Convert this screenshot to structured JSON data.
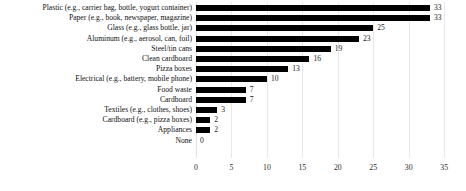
{
  "chart_data": {
    "type": "bar",
    "orientation": "horizontal",
    "title": "",
    "subtitle": "",
    "xlabel": "",
    "ylabel": "",
    "xlim": [
      0,
      35
    ],
    "xticks": [
      0,
      5,
      10,
      15,
      20,
      25,
      30,
      35
    ],
    "grid": true,
    "legend": null,
    "bar_color": "#000000",
    "gridline_color": "#e8e8e8",
    "categories": [
      "Plastic (e.g., carrier bag, bottle, yogurt container)",
      "Paper (e.g., book, newspaper, magazine)",
      "Glass (e.g., glass bottle, jar)",
      "Aluminum (e.g., aerosol, can, foil)",
      "Steel/tin cans",
      "Clean cardboard",
      "Pizza boxes",
      "Electrical (e.g., battery, mobile phone)",
      "Food waste",
      "Cardboard",
      "Textiles (e.g., clothes, shoes)",
      "Cardboard (e.g., pizza boxes)",
      "Appliances",
      "None"
    ],
    "values": [
      33,
      33,
      25,
      23,
      19,
      16,
      13,
      10,
      7,
      7,
      3,
      2,
      2,
      0
    ],
    "value_labels": [
      "33",
      "33",
      "25",
      "23",
      "19",
      "16",
      "13",
      "10",
      "7",
      "7",
      "3",
      "2",
      "2",
      "0"
    ],
    "xtick_labels": [
      "0",
      "5",
      "10",
      "15",
      "20",
      "25",
      "30",
      "35"
    ]
  }
}
